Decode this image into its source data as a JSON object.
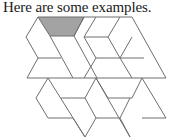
{
  "caption": "Here are some examples.",
  "figure": {
    "shaded_piece": "trapezoid",
    "colors": {
      "line": "#6e6e6e",
      "shade": "#a3a3a3",
      "background": "#ffffff"
    }
  }
}
